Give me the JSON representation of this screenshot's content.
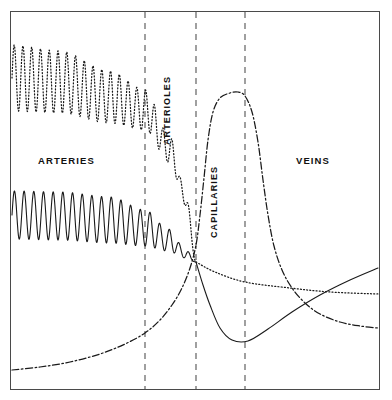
{
  "figure": {
    "background_color": "#ffffff",
    "frame_color": "#4a4a4a",
    "curve_color": "#1a1a1a",
    "divider_color": "#6d6d6d",
    "frame": {
      "x": 10,
      "y": 11,
      "width": 370,
      "height": 379
    }
  },
  "zones": [
    {
      "id": "arteries",
      "label": "ARTERIES",
      "orientation": "horizontal",
      "x": 38,
      "y": 155
    },
    {
      "id": "arterioles",
      "label": "ARTERIOLES",
      "orientation": "vertical",
      "x": 172,
      "y": 135
    },
    {
      "id": "capillaries",
      "label": "CAPILLARIES",
      "orientation": "vertical",
      "x": 219,
      "y": 228
    },
    {
      "id": "veins",
      "label": "VEINS",
      "orientation": "horizontal",
      "x": 296,
      "y": 155
    }
  ],
  "dividers": [
    {
      "id": "arteries-arterioles",
      "x": 145
    },
    {
      "id": "arterioles-capillaries",
      "x": 196
    },
    {
      "id": "capillaries-veins",
      "x": 245
    }
  ],
  "chart_data": {
    "type": "line",
    "xlabel": "",
    "ylabel": "",
    "grid": false,
    "legend": "none",
    "axis_ranges": {
      "x": [
        10,
        380
      ],
      "y": [
        11,
        390
      ]
    },
    "categories": [
      "ARTERIES",
      "ARTERIOLES",
      "CAPILLARIES",
      "VEINS"
    ],
    "series": [
      {
        "name": "blood-pressure-upper",
        "style": "dotted",
        "description": "Pulsatile pressure envelope, damping through arterioles",
        "oscillating": true,
        "osc_cycles": 21,
        "osc_end_x": 196,
        "baseline": [
          {
            "x": 12,
            "y": 78
          },
          {
            "x": 60,
            "y": 82
          },
          {
            "x": 110,
            "y": 97
          },
          {
            "x": 145,
            "y": 110
          },
          {
            "x": 170,
            "y": 150
          },
          {
            "x": 186,
            "y": 200
          },
          {
            "x": 196,
            "y": 262
          }
        ],
        "amplitude": [
          {
            "x": 12,
            "a": 33
          },
          {
            "x": 60,
            "a": 31
          },
          {
            "x": 110,
            "a": 26
          },
          {
            "x": 145,
            "a": 20
          },
          {
            "x": 170,
            "a": 13
          },
          {
            "x": 186,
            "a": 6
          },
          {
            "x": 196,
            "a": 0
          }
        ],
        "tail": [
          {
            "x": 196,
            "y": 262
          },
          {
            "x": 215,
            "y": 272
          },
          {
            "x": 245,
            "y": 282
          },
          {
            "x": 290,
            "y": 288
          },
          {
            "x": 330,
            "y": 292
          },
          {
            "x": 378,
            "y": 294
          }
        ]
      },
      {
        "name": "blood-pressure-lower",
        "style": "solid",
        "description": "Mean arterial pressure falling to minimum in capillaries then flow velocity rising in veins",
        "oscillating": true,
        "osc_cycles": 19,
        "osc_end_x": 196,
        "baseline": [
          {
            "x": 12,
            "y": 215
          },
          {
            "x": 60,
            "y": 216
          },
          {
            "x": 110,
            "y": 220
          },
          {
            "x": 145,
            "y": 228
          },
          {
            "x": 168,
            "y": 240
          },
          {
            "x": 186,
            "y": 254
          },
          {
            "x": 196,
            "y": 262
          }
        ],
        "amplitude": [
          {
            "x": 12,
            "a": 24
          },
          {
            "x": 60,
            "a": 24
          },
          {
            "x": 110,
            "a": 23
          },
          {
            "x": 145,
            "a": 18
          },
          {
            "x": 168,
            "a": 11
          },
          {
            "x": 186,
            "a": 4
          },
          {
            "x": 196,
            "a": 0
          }
        ],
        "tail": [
          {
            "x": 196,
            "y": 262
          },
          {
            "x": 203,
            "y": 285
          },
          {
            "x": 210,
            "y": 305
          },
          {
            "x": 220,
            "y": 328
          },
          {
            "x": 232,
            "y": 340
          },
          {
            "x": 248,
            "y": 341
          },
          {
            "x": 268,
            "y": 329
          },
          {
            "x": 292,
            "y": 312
          },
          {
            "x": 320,
            "y": 295
          },
          {
            "x": 350,
            "y": 280
          },
          {
            "x": 378,
            "y": 268
          }
        ]
      },
      {
        "name": "cross-sectional-area",
        "style": "dash-dot",
        "description": "Total cross-sectional area: low in arteries, maximal in capillaries, intermediate in veins",
        "oscillating": false,
        "points": [
          {
            "x": 12,
            "y": 370
          },
          {
            "x": 40,
            "y": 367
          },
          {
            "x": 70,
            "y": 362
          },
          {
            "x": 100,
            "y": 354
          },
          {
            "x": 125,
            "y": 344
          },
          {
            "x": 145,
            "y": 333
          },
          {
            "x": 160,
            "y": 320
          },
          {
            "x": 172,
            "y": 305
          },
          {
            "x": 182,
            "y": 288
          },
          {
            "x": 190,
            "y": 268
          },
          {
            "x": 196,
            "y": 245
          },
          {
            "x": 200,
            "y": 215
          },
          {
            "x": 204,
            "y": 178
          },
          {
            "x": 208,
            "y": 140
          },
          {
            "x": 213,
            "y": 112
          },
          {
            "x": 220,
            "y": 98
          },
          {
            "x": 230,
            "y": 93
          },
          {
            "x": 238,
            "y": 92
          },
          {
            "x": 245,
            "y": 96
          },
          {
            "x": 252,
            "y": 112
          },
          {
            "x": 258,
            "y": 142
          },
          {
            "x": 263,
            "y": 180
          },
          {
            "x": 268,
            "y": 215
          },
          {
            "x": 274,
            "y": 246
          },
          {
            "x": 282,
            "y": 270
          },
          {
            "x": 292,
            "y": 288
          },
          {
            "x": 305,
            "y": 303
          },
          {
            "x": 320,
            "y": 314
          },
          {
            "x": 340,
            "y": 322
          },
          {
            "x": 360,
            "y": 326
          },
          {
            "x": 378,
            "y": 328
          }
        ]
      }
    ]
  }
}
